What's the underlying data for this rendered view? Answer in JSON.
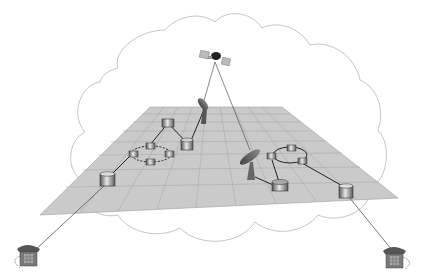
{
  "diagram": {
    "title": "",
    "colors": {
      "background": "#ffffff",
      "cloud_stroke": "#b5b5b5",
      "plane_fill": "#c9c9c9",
      "plane_grid": "#a8a8a8",
      "node_fill": "#8a8a8a",
      "node_top": "#d8d8d8",
      "link": "#2a2a2a",
      "phone": "#6b6b6b"
    },
    "elements": {
      "cloud": {
        "label": ""
      },
      "satellite": {
        "label": ""
      },
      "plane": {
        "label": ""
      },
      "left_cluster": {
        "label": "",
        "nodes": 5,
        "ring_nodes": 4
      },
      "right_cluster": {
        "label": "",
        "nodes": 5,
        "ring_nodes": 3
      },
      "dish_left": {
        "label": ""
      },
      "dish_right": {
        "label": ""
      },
      "phone_left": {
        "label": ""
      },
      "phone_right": {
        "label": ""
      }
    }
  }
}
